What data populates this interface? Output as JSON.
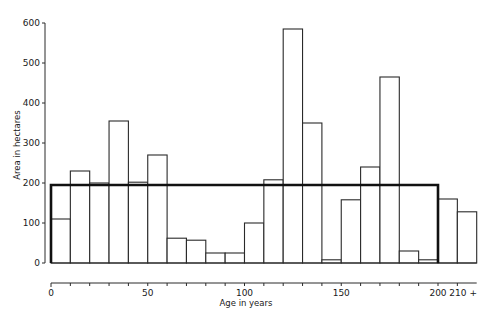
{
  "chart_data": {
    "type": "bar",
    "title": "",
    "xlabel": "Age in years",
    "ylabel": "Area in hectares",
    "ylim": [
      0,
      600
    ],
    "yticks": [
      0,
      100,
      200,
      300,
      400,
      500,
      600
    ],
    "xticks_labeled": [
      {
        "value": 0,
        "label": "0"
      },
      {
        "value": 50,
        "label": "50"
      },
      {
        "value": 100,
        "label": "100"
      },
      {
        "value": 150,
        "label": "150"
      },
      {
        "value": 200,
        "label": "200"
      },
      {
        "value": 210,
        "label": "210 +"
      }
    ],
    "xtick_interval": 10,
    "bin_width_years": 10,
    "grid": false,
    "legend": null,
    "categories": [
      "0-10",
      "10-20",
      "20-30",
      "30-40",
      "40-50",
      "50-60",
      "60-70",
      "70-80",
      "80-90",
      "90-100",
      "100-110",
      "110-120",
      "120-130",
      "130-140",
      "140-150",
      "150-160",
      "160-170",
      "170-180",
      "180-190",
      "190-200",
      "200-210",
      "210+"
    ],
    "bin_starts": [
      0,
      10,
      20,
      30,
      40,
      50,
      60,
      70,
      80,
      90,
      100,
      110,
      120,
      130,
      140,
      150,
      160,
      170,
      180,
      190,
      200,
      210
    ],
    "values": [
      110,
      230,
      200,
      355,
      202,
      270,
      62,
      57,
      25,
      25,
      100,
      208,
      585,
      350,
      8,
      158,
      240,
      465,
      30,
      8,
      160,
      128
    ],
    "annotations": [
      {
        "type": "reference-rectangle",
        "description": "Thick outlined box showing uniform (normal) age-class distribution",
        "x_start": 0,
        "x_end": 200,
        "y_value": 195
      }
    ]
  }
}
